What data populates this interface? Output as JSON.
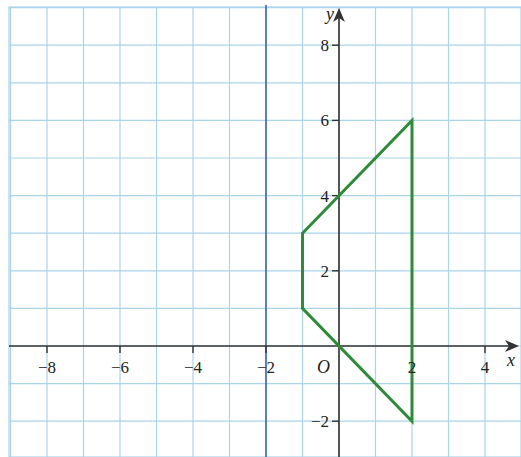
{
  "chart_data": {
    "type": "line",
    "title": "",
    "xlabel": "x",
    "ylabel": "y",
    "origin_label": "O",
    "xlim": [
      -9,
      5
    ],
    "ylim": [
      -3,
      9
    ],
    "grid": true,
    "x_ticks": [
      -8,
      -6,
      -4,
      -2,
      2,
      4
    ],
    "y_ticks": [
      -2,
      2,
      4,
      6,
      8
    ],
    "x_tick_labels": [
      "−8",
      "−6",
      "−4",
      "−2",
      "2",
      "4"
    ],
    "y_tick_labels": [
      "−2",
      "2",
      "4",
      "6",
      "8"
    ],
    "mirror_line": {
      "equation": "x = -2",
      "x": -2,
      "color": "#3b67b0"
    },
    "series": [
      {
        "name": "quadrilateral",
        "closed": true,
        "color": "#2e8b3a",
        "points": [
          [
            -1,
            3
          ],
          [
            2,
            6
          ],
          [
            2,
            -2
          ],
          [
            -1,
            1
          ]
        ]
      }
    ]
  },
  "colors": {
    "grid": "#a9d4ec",
    "axis": "#333333",
    "shape": "#2e8b3a",
    "mirror_line": "#3b67b0"
  }
}
